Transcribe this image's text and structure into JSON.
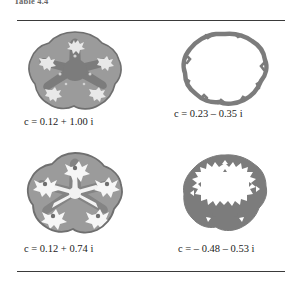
{
  "header": {
    "label": "Table 4.4"
  },
  "figure": {
    "rule_color": "#3a3a3a",
    "cells": [
      {
        "id": "julia-top-left",
        "style": "filled-star",
        "caption": {
          "var": "c",
          "eq": "=",
          "real": "0.12",
          "op": "+",
          "imag": "1.00",
          "unit": "i",
          "full": "c = 0.12 + 1.00 i"
        },
        "colors": {
          "lobe": "#9b9b9b",
          "arm": "#7c7c7c",
          "detail": "#e8e8e8",
          "edge": "#6f6f6f"
        }
      },
      {
        "id": "julia-top-right",
        "style": "outline-smooth",
        "caption": {
          "var": "c",
          "eq": "=",
          "real": "0.23",
          "op": "–",
          "imag": "0.35",
          "unit": "i",
          "full": "c = 0.23 – 0.35 i"
        },
        "colors": {
          "lobe": "#ffffff",
          "arm": "#ffffff",
          "detail": "#ffffff",
          "edge": "#7c7c7c"
        }
      },
      {
        "id": "julia-bottom-left",
        "style": "filled-dendrite",
        "caption": {
          "var": "c",
          "eq": "=",
          "real": "0.12",
          "op": "+",
          "imag": "0.74",
          "unit": "i",
          "full": "c = 0.12 + 0.74 i"
        },
        "colors": {
          "lobe": "#9b9b9b",
          "arm": "#848484",
          "detail": "#f2f2f2",
          "edge": "#6f6f6f"
        }
      },
      {
        "id": "julia-bottom-right",
        "style": "outline-jagged",
        "caption": {
          "var": "c",
          "eq": "=",
          "real": "– 0.48",
          "op": "–",
          "imag": "0.53",
          "unit": "i",
          "full": "c = – 0.48 – 0.53 i"
        },
        "colors": {
          "lobe": "#ffffff",
          "arm": "#ffffff",
          "detail": "#ffffff",
          "edge": "#7c7c7c"
        }
      }
    ]
  }
}
